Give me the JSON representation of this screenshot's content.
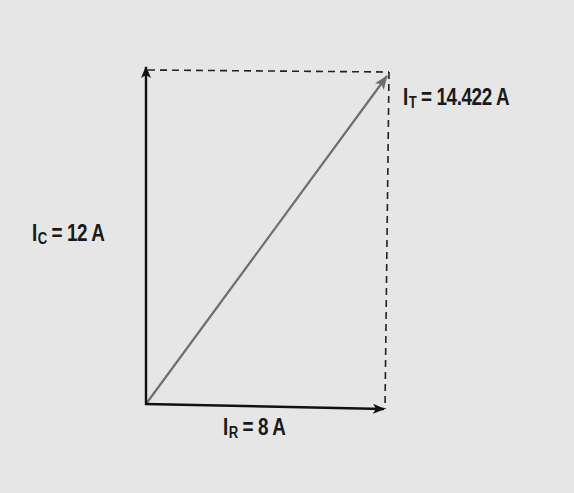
{
  "diagram": {
    "background": "#e6e6e6",
    "colors": {
      "axis": "#111111",
      "resultant": "#6e6e6e",
      "dashed": "#222222",
      "text": "#1a1a1a"
    },
    "vectors": [
      {
        "name": "IR",
        "label_main": "I",
        "label_sub": "R",
        "label_rest": " = 8 A",
        "value": 8,
        "unit": "A",
        "direction": "horizontal"
      },
      {
        "name": "IC",
        "label_main": "I",
        "label_sub": "C",
        "label_rest": " = 12 A",
        "value": 12,
        "unit": "A",
        "direction": "vertical"
      },
      {
        "name": "IT",
        "label_main": "I",
        "label_sub": "T",
        "label_rest": " = 14.422 A",
        "value": 14.422,
        "unit": "A",
        "direction": "diagonal resultant"
      }
    ]
  }
}
